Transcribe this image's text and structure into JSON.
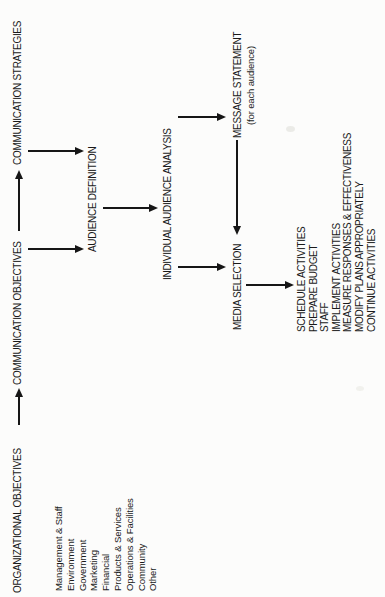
{
  "diagram": {
    "orientation": "rotated-90-ccw",
    "nodes": {
      "org_objectives": {
        "label": "ORGANIZATIONAL OBJECTIVES"
      },
      "comm_objectives": {
        "label": "COMMUNICATION OBJECTIVES"
      },
      "comm_strategies": {
        "label": "COMMUNICATION STRATEGIES"
      },
      "audience_definition": {
        "label": "AUDIENCE DEFINITION"
      },
      "individual_audience_analysis": {
        "label": "INDIVIDUAL AUDIENCE ANALYSIS"
      },
      "message_statement": {
        "label": "MESSAGE STATEMENT",
        "caption": "(for each audience)"
      },
      "media_selection": {
        "label": "MEDIA SELECTION"
      }
    },
    "org_breakdown": {
      "items": [
        "Management & Staff",
        "Environment",
        "Government",
        "Marketing",
        "Financial",
        "Products & Services",
        "Operations & Facilities",
        "Community",
        "Other"
      ]
    },
    "implementation_steps": {
      "items": [
        "SCHEDULE ACTIVITIES",
        "PREPARE BUDGET",
        "STAFF",
        "IMPLEMENT ACTIVITIES",
        "MEASURE RESPONSES & EFFECTIVENESS",
        "MODIFY PLANS APPROPRIATELY",
        "CONTINUE ACTIVITIES"
      ]
    },
    "connections": [
      {
        "from": "org_objectives",
        "to": "comm_objectives"
      },
      {
        "from": "comm_objectives",
        "to": "comm_strategies"
      },
      {
        "from": "comm_objectives",
        "to": "audience_definition"
      },
      {
        "from": "comm_strategies",
        "to": "audience_definition"
      },
      {
        "from": "audience_definition",
        "to": "individual_audience_analysis"
      },
      {
        "from": "individual_audience_analysis",
        "to": "message_statement"
      },
      {
        "from": "individual_audience_analysis",
        "to": "media_selection"
      },
      {
        "from": "message_statement",
        "to": "media_selection"
      },
      {
        "from": "media_selection",
        "to": "implementation_steps"
      }
    ],
    "colors": {
      "ink": "#1a1a1a",
      "paper": "#fcfcfb"
    }
  }
}
